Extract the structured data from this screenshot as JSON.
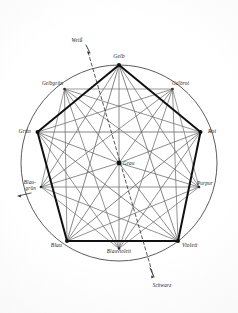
{
  "diagram": {
    "center": {
      "label": "Grau",
      "name": "center-node-grau"
    },
    "primary_vertices": [
      {
        "label": "Gelb",
        "angle_deg": 90,
        "cx": 119.0,
        "cy": 65.0,
        "label_x": 119.0,
        "label_y": 58.0,
        "anchor": "middle"
      },
      {
        "label": "Rot",
        "angle_deg": 18,
        "cx": 200.5,
        "cy": 132.0,
        "label_x": 208.0,
        "label_y": 133.0,
        "anchor": "start"
      },
      {
        "label": "Violett",
        "angle_deg": 306,
        "cx": 178.0,
        "cy": 241.0,
        "label_x": 182.0,
        "label_y": 247.0,
        "anchor": "start"
      },
      {
        "label": "Blau",
        "angle_deg": 234,
        "cx": 67.0,
        "cy": 241.0,
        "label_x": 62.0,
        "label_y": 247.0,
        "anchor": "end"
      },
      {
        "label": "Grün",
        "angle_deg": 162,
        "cx": 37.5,
        "cy": 132.0,
        "label_x": 31.0,
        "label_y": 133.0,
        "anchor": "end"
      }
    ],
    "secondary_vertices": [
      {
        "label": "Gelbrot",
        "angle_deg": 54,
        "cx": 172.5,
        "cy": 89.0,
        "label_x": 172.0,
        "label_y": 85.0,
        "anchor": "start"
      },
      {
        "label": "Purpur",
        "angle_deg": 342,
        "cx": 199.0,
        "cy": 187.0,
        "label_x": 197.0,
        "label_y": 185.0,
        "anchor": "start"
      },
      {
        "label": "Blauviolett",
        "angle_deg": 270,
        "cx": 119.0,
        "cy": 248.5,
        "label_x": 119.0,
        "label_y": 253.0,
        "anchor": "middle"
      },
      {
        "label": "Blaugrün",
        "angle_deg": 198,
        "cx": 41.0,
        "cy": 187.0,
        "label_x": 36.0,
        "label_y": 184.0,
        "anchor": "end"
      },
      {
        "label": "Gelbgrün",
        "angle_deg": 126,
        "cx": 64.5,
        "cy": 89.0,
        "label_x": 63.0,
        "label_y": 85.0,
        "anchor": "end"
      }
    ],
    "axis": {
      "white": {
        "label": "Weiß",
        "label_x": 77.0,
        "label_y": 42.0,
        "anchor": "middle",
        "arrow_from_x": 86.0,
        "arrow_from_y": 45.0,
        "arrow_to_x": 90.0,
        "arrow_to_y": 53.0
      },
      "black": {
        "label": "Schwarz",
        "label_x": 162.0,
        "label_y": 287.0,
        "anchor": "middle",
        "arrow_from_x": 150.0,
        "arrow_from_y": 268.0,
        "arrow_to_x": 154.0,
        "arrow_to_y": 277.0
      },
      "dash_start_x": 88.0,
      "dash_start_y": 52.0,
      "dash_end_x": 153.0,
      "dash_end_y": 275.0
    },
    "blaugruen_leader": {
      "from_x": 18.0,
      "from_y": 196.0,
      "to_x": 31.0,
      "to_y": 193.0
    },
    "circle": {
      "cx": 119.0,
      "cy": 163.0,
      "r": 98.0,
      "stroke": "#4a4a4a",
      "stroke_width": 0.9
    },
    "colors": {
      "ink": "#2b2b2b",
      "ink_light": "#5c5c5c",
      "ink_faint": "#6e6e6e",
      "bold": "#111111",
      "paper": "#ffffff"
    },
    "stroke_widths": {
      "pentagon_bold": 2.0,
      "chord": 0.75,
      "spoke": 0.7,
      "inner": 0.7,
      "dash": 0.8
    }
  }
}
